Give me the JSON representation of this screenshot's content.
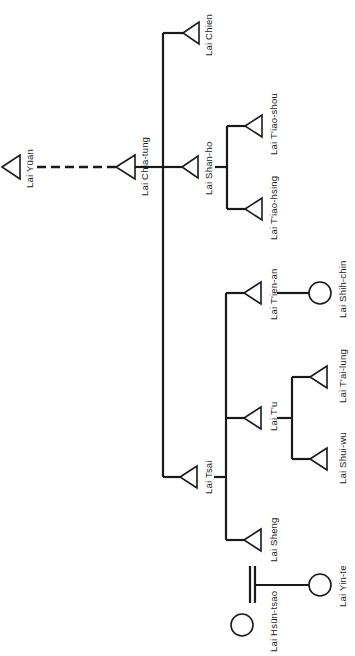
{
  "diagram": {
    "colors": {
      "ink": "#1a1a1a",
      "background": "#ffffff"
    },
    "legend_shapes": {
      "triangle": "male",
      "circle": "female",
      "double_bar": "adoption/marriage link"
    },
    "people": {
      "yuan": {
        "name": "Lai Yüan",
        "sex": "male"
      },
      "chia_tung": {
        "name": "Lai Chia-tung",
        "sex": "male"
      },
      "chien": {
        "name": "Lai Chien",
        "sex": "male"
      },
      "shan_ho": {
        "name": "Lai Shan-ho",
        "sex": "male"
      },
      "tiao_shou": {
        "name": "Lai T'iao-shou",
        "sex": "male"
      },
      "tiao_hsing": {
        "name": "Lai T'iao-hsing",
        "sex": "male"
      },
      "tsai": {
        "name": "Lai Tsai",
        "sex": "male"
      },
      "tien_an": {
        "name": "Lai T'ien-an",
        "sex": "male"
      },
      "shih_chin": {
        "name": "Lai Shih-chin",
        "sex": "female"
      },
      "tu": {
        "name": "Lai T'u",
        "sex": "male"
      },
      "tai_lung": {
        "name": "Lai T'ai-lung",
        "sex": "male"
      },
      "shui_wu": {
        "name": "Lai Shui-wu",
        "sex": "male"
      },
      "sheng": {
        "name": "Lai Sheng",
        "sex": "male"
      },
      "yin_te": {
        "name": "Lai Yin-te",
        "sex": "female"
      },
      "hsun_tsao": {
        "name": "Lai Hsün-tsao",
        "sex": "female"
      }
    },
    "relations": [
      {
        "from": "Lai Yüan",
        "to": "Lai Chia-tung",
        "type": "descent (dashed, generations omitted)"
      },
      {
        "from": "Lai Chia-tung",
        "to": [
          "Lai Chien",
          "Lai Shan-ho",
          "Lai Tsai"
        ],
        "type": "children"
      },
      {
        "from": "Lai Shan-ho",
        "to": [
          "Lai T'iao-shou",
          "Lai T'iao-hsing"
        ],
        "type": "children"
      },
      {
        "from": "Lai Tsai",
        "to": [
          "Lai T'ien-an",
          "Lai T'u",
          "Lai Sheng"
        ],
        "type": "children"
      },
      {
        "from": "Lai T'ien-an",
        "to": "Lai Shih-chin",
        "type": "child"
      },
      {
        "from": "Lai T'u",
        "to": [
          "Lai T'ai-lung",
          "Lai Shui-wu"
        ],
        "type": "children"
      },
      {
        "from": "Lai Yin-te",
        "to": "Lai Hsün-tsao",
        "type": "double-bar link"
      }
    ]
  }
}
